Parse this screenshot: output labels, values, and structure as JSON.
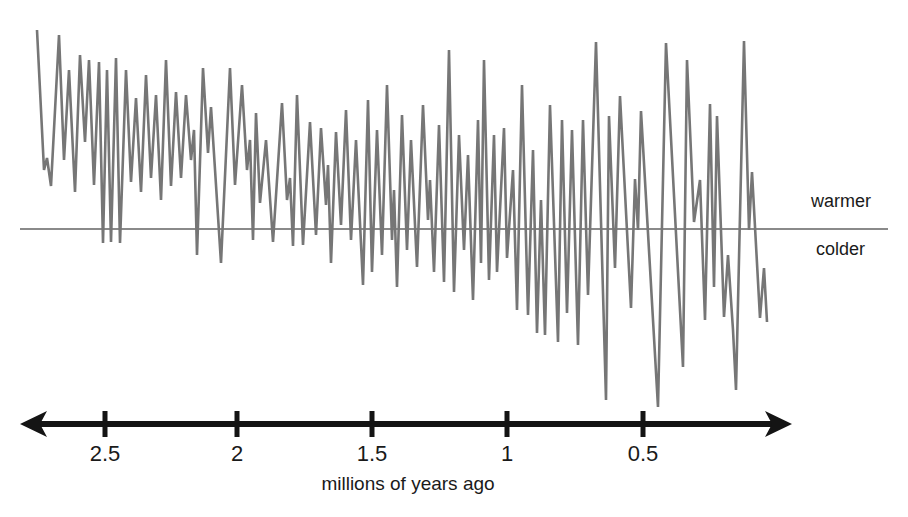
{
  "labels": {
    "warmer": "warmer",
    "colder": "colder",
    "x_axis_title": "millions of years ago"
  },
  "chart_data": {
    "type": "line",
    "title": "",
    "x_axis": {
      "label": "millions of years ago",
      "ticks": [
        {
          "label": "2.5",
          "value_myr": 2.5,
          "x_px": 105
        },
        {
          "label": "2",
          "value_myr": 2.0,
          "x_px": 237
        },
        {
          "label": "1.5",
          "value_myr": 1.5,
          "x_px": 372
        },
        {
          "label": "1",
          "value_myr": 1.0,
          "x_px": 507
        },
        {
          "label": "0.5",
          "value_myr": 0.5,
          "x_px": 643
        }
      ],
      "range_myr": [
        2.75,
        0.03
      ],
      "direction": "time increases to the left; arrowheads on both ends of axis"
    },
    "y_axis": {
      "label_above_baseline": "warmer",
      "label_below_baseline": "colder",
      "numeric_scale": "none shown (qualitative schematic)",
      "baseline_meaning": "boundary between warmer and colder conditions"
    },
    "series": [
      {
        "name": "temperature oscillations (glacial-interglacial cycles)",
        "points_px": [
          [
            37,
            30
          ],
          [
            44,
            170
          ],
          [
            47,
            158
          ],
          [
            51,
            186
          ],
          [
            59,
            35
          ],
          [
            64,
            160
          ],
          [
            69,
            70
          ],
          [
            75,
            192
          ],
          [
            80,
            55
          ],
          [
            85,
            142
          ],
          [
            89,
            60
          ],
          [
            94,
            185
          ],
          [
            99,
            62
          ],
          [
            103,
            243
          ],
          [
            107,
            70
          ],
          [
            111,
            242
          ],
          [
            116,
            58
          ],
          [
            120,
            243
          ],
          [
            126,
            70
          ],
          [
            131,
            182
          ],
          [
            136,
            98
          ],
          [
            141,
            192
          ],
          [
            146,
            75
          ],
          [
            151,
            178
          ],
          [
            156,
            95
          ],
          [
            161,
            200
          ],
          [
            166,
            60
          ],
          [
            171,
            186
          ],
          [
            176,
            92
          ],
          [
            181,
            178
          ],
          [
            186,
            95
          ],
          [
            191,
            160
          ],
          [
            194,
            130
          ],
          [
            197,
            255
          ],
          [
            203,
            68
          ],
          [
            208,
            153
          ],
          [
            211,
            107
          ],
          [
            221,
            263
          ],
          [
            230,
            68
          ],
          [
            235,
            185
          ],
          [
            242,
            85
          ],
          [
            247,
            170
          ],
          [
            250,
            140
          ],
          [
            253,
            240
          ],
          [
            256,
            113
          ],
          [
            260,
            203
          ],
          [
            266,
            140
          ],
          [
            273,
            242
          ],
          [
            282,
            103
          ],
          [
            287,
            200
          ],
          [
            290,
            178
          ],
          [
            293,
            246
          ],
          [
            297,
            95
          ],
          [
            303,
            245
          ],
          [
            310,
            122
          ],
          [
            316,
            235
          ],
          [
            321,
            128
          ],
          [
            326,
            205
          ],
          [
            328,
            165
          ],
          [
            331,
            263
          ],
          [
            336,
            132
          ],
          [
            341,
            225
          ],
          [
            346,
            110
          ],
          [
            351,
            240
          ],
          [
            356,
            140
          ],
          [
            363,
            285
          ],
          [
            368,
            100
          ],
          [
            372,
            272
          ],
          [
            377,
            130
          ],
          [
            382,
            255
          ],
          [
            387,
            85
          ],
          [
            392,
            240
          ],
          [
            394,
            190
          ],
          [
            397,
            287
          ],
          [
            402,
            115
          ],
          [
            407,
            250
          ],
          [
            411,
            140
          ],
          [
            417,
            267
          ],
          [
            423,
            105
          ],
          [
            428,
            220
          ],
          [
            430,
            180
          ],
          [
            434,
            272
          ],
          [
            439,
            125
          ],
          [
            444,
            282
          ],
          [
            449,
            50
          ],
          [
            454,
            292
          ],
          [
            459,
            135
          ],
          [
            464,
            250
          ],
          [
            468,
            155
          ],
          [
            473,
            300
          ],
          [
            478,
            120
          ],
          [
            481,
            263
          ],
          [
            484,
            60
          ],
          [
            489,
            280
          ],
          [
            494,
            135
          ],
          [
            497,
            272
          ],
          [
            504,
            128
          ],
          [
            507,
            258
          ],
          [
            513,
            170
          ],
          [
            517,
            310
          ],
          [
            522,
            85
          ],
          [
            528,
            315
          ],
          [
            533,
            150
          ],
          [
            537,
            333
          ],
          [
            541,
            200
          ],
          [
            545,
            335
          ],
          [
            550,
            105
          ],
          [
            558,
            342
          ],
          [
            562,
            120
          ],
          [
            567,
            313
          ],
          [
            572,
            130
          ],
          [
            578,
            345
          ],
          [
            583,
            120
          ],
          [
            588,
            295
          ],
          [
            596,
            42
          ],
          [
            606,
            400
          ],
          [
            609,
            116
          ],
          [
            615,
            268
          ],
          [
            620,
            96
          ],
          [
            631,
            308
          ],
          [
            635,
            179
          ],
          [
            638,
            230
          ],
          [
            641,
            111
          ],
          [
            658,
            407
          ],
          [
            666,
            43
          ],
          [
            683,
            367
          ],
          [
            687,
            60
          ],
          [
            694,
            222
          ],
          [
            700,
            180
          ],
          [
            705,
            320
          ],
          [
            710,
            104
          ],
          [
            714,
            287
          ],
          [
            717,
            116
          ],
          [
            724,
            317
          ],
          [
            728,
            255
          ],
          [
            733,
            330
          ],
          [
            736,
            390
          ],
          [
            744,
            41
          ],
          [
            749,
            230
          ],
          [
            752,
            172
          ],
          [
            760,
            318
          ],
          [
            764,
            268
          ],
          [
            767,
            322
          ]
        ]
      }
    ],
    "calibration": {
      "note": "Convert pixel coords to data: myr_ago = 2.5 - (x_px - 105)/269 ; anomaly = (229 - y_px)/199 where +1 = warmest peak, 0 = warmer/colder baseline, negative = colder",
      "x_px_per_myr": 269,
      "x_px_at_2_5_myr": 105,
      "baseline_y_px": 229,
      "y_px_per_anomaly_unit": 199
    },
    "layout": {
      "grid": "off",
      "legend": "none",
      "baseline_px": {
        "x1": 20,
        "x2": 888,
        "y": 229,
        "stroke_width": 2
      },
      "axis_px": {
        "y": 424,
        "x1": 38,
        "x2": 774,
        "stroke_width": 6,
        "arrow_tip_left_x": 20,
        "arrow_tip_right_x": 792,
        "tick_top": 411,
        "tick_height": 26,
        "tick_width": 5
      }
    },
    "colors": {
      "series_line": "#767676",
      "baseline": "#8a8a8a",
      "axis": "#141414",
      "text": "#1a1a1a",
      "background": "#ffffff"
    }
  }
}
